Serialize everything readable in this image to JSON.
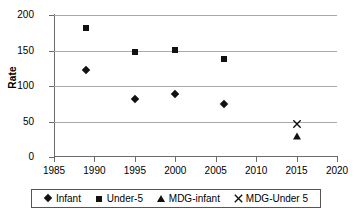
{
  "chart_data": {
    "type": "scatter",
    "title": "",
    "xlabel": "",
    "ylabel": "Rate",
    "xlim": [
      1985,
      2020
    ],
    "ylim": [
      0,
      200
    ],
    "xticks": [
      1985,
      1990,
      1995,
      2000,
      2005,
      2010,
      2015,
      2020
    ],
    "yticks": [
      0,
      50,
      100,
      150,
      200
    ],
    "grid": "horizontal",
    "legend_position": "bottom",
    "series": [
      {
        "name": "Infant",
        "marker": "diamond",
        "color": "#111111",
        "points": [
          {
            "x": 1989,
            "y": 122
          },
          {
            "x": 1995,
            "y": 81
          },
          {
            "x": 2000,
            "y": 89
          },
          {
            "x": 2006,
            "y": 74
          }
        ]
      },
      {
        "name": "Under-5",
        "marker": "square",
        "color": "#111111",
        "points": [
          {
            "x": 1989,
            "y": 181
          },
          {
            "x": 1995,
            "y": 148
          },
          {
            "x": 2000,
            "y": 151
          },
          {
            "x": 2006,
            "y": 138
          }
        ]
      },
      {
        "name": "MDG-infant",
        "marker": "triangle",
        "color": "#111111",
        "points": [
          {
            "x": 2015,
            "y": 30
          }
        ]
      },
      {
        "name": "MDG-Under 5",
        "marker": "x",
        "color": "#111111",
        "points": [
          {
            "x": 2015,
            "y": 53
          }
        ]
      }
    ]
  },
  "axis": {
    "y_title": "Rate",
    "y_tick_labels": [
      "200",
      "150",
      "100",
      "50",
      "0"
    ],
    "x_tick_labels": [
      "1985",
      "1990",
      "1995",
      "2000",
      "2005",
      "2010",
      "2015",
      "2020"
    ]
  },
  "legend": {
    "entries": [
      {
        "label": "Infant",
        "marker": "diamond"
      },
      {
        "label": "Under-5",
        "marker": "square"
      },
      {
        "label": "MDG-infant",
        "marker": "triangle"
      },
      {
        "label": "MDG-Under 5",
        "marker": "x"
      }
    ]
  },
  "colors": {
    "marker": "#111111",
    "gridline": "#a9a9a9",
    "axis": "#6b6b6b",
    "legend_border": "#555555",
    "background": "#ffffff"
  }
}
